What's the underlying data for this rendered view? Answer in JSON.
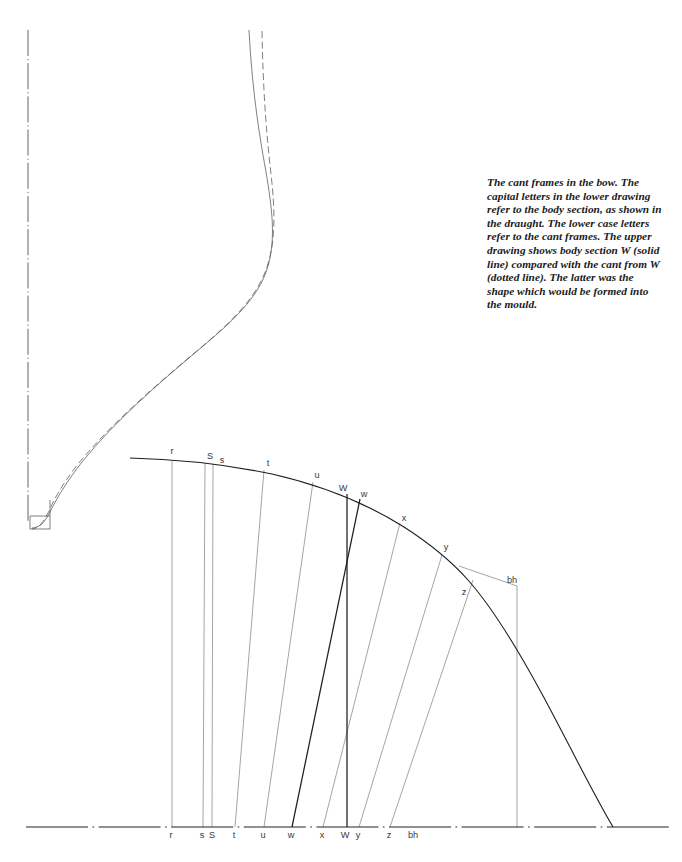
{
  "figure": {
    "caption": "The cant frames in the bow. The capital letters in the lower drawing refer to the body section, as shown in the draught. The lower case letters refer to the cant frames. The upper drawing shows body section W (solid line) compared with the cant from W (dotted line). The latter was the shape which would be formed into the mould.",
    "colors": {
      "ink": "#1e1e1e",
      "line": "#4a4a4a",
      "label": "#3a3a3a",
      "background": "#ffffff"
    }
  },
  "upper_drawing": {
    "name": "body-section-vs-cant-frame-W",
    "centerline": {
      "x": 28,
      "y_top": 30,
      "y_bottom": 522
    },
    "keel": {
      "x": 30,
      "y": 516,
      "width": 20,
      "height": 13
    },
    "solid_line_label": "W (solid line) body section",
    "dotted_line_label": "cant from W (dotted line)"
  },
  "lower_drawing": {
    "name": "cant-frames-plan",
    "baseline_y": 827,
    "curve_start": {
      "x": 130,
      "y": 458
    },
    "curve_end": {
      "x": 613,
      "y": 827
    },
    "curve_labels": [
      {
        "id": "r",
        "text": "r",
        "x": 172,
        "y": 454
      },
      {
        "id": "S",
        "text": "S",
        "x": 210,
        "y": 459
      },
      {
        "id": "s",
        "text": "s",
        "x": 222,
        "y": 463
      },
      {
        "id": "t",
        "text": "t",
        "x": 268,
        "y": 466
      },
      {
        "id": "u",
        "text": "u",
        "x": 317,
        "y": 478
      },
      {
        "id": "W",
        "text": "W",
        "x": 343,
        "y": 491
      },
      {
        "id": "w",
        "text": "w",
        "x": 364,
        "y": 497
      },
      {
        "id": "x",
        "text": "x",
        "x": 404,
        "y": 521
      },
      {
        "id": "y",
        "text": "y",
        "x": 446,
        "y": 550
      },
      {
        "id": "z",
        "text": "z",
        "x": 464,
        "y": 595
      },
      {
        "id": "bh",
        "text": "bh",
        "x": 512,
        "y": 583
      }
    ],
    "baseline_labels": [
      {
        "id": "r",
        "text": "r",
        "x": 171
      },
      {
        "id": "s",
        "text": "s",
        "x": 202
      },
      {
        "id": "S",
        "text": "S",
        "x": 212
      },
      {
        "id": "t",
        "text": "t",
        "x": 234
      },
      {
        "id": "u",
        "text": "u",
        "x": 263
      },
      {
        "id": "w",
        "text": "w",
        "x": 291
      },
      {
        "id": "x",
        "text": "x",
        "x": 322
      },
      {
        "id": "W",
        "text": "W",
        "x": 345
      },
      {
        "id": "y",
        "text": "y",
        "x": 358
      },
      {
        "id": "z",
        "text": "z",
        "x": 389
      },
      {
        "id": "bh",
        "text": "bh",
        "x": 413
      }
    ],
    "baseline_label_y": 838,
    "frame_lines": [
      {
        "id": "r",
        "top_x": 172,
        "top_y": 461,
        "bottom_x": 172,
        "bottom_y": 827,
        "weight": "thin"
      },
      {
        "id": "s",
        "top_x": 205,
        "top_y": 463,
        "bottom_x": 203,
        "bottom_y": 827,
        "weight": "thin"
      },
      {
        "id": "S",
        "top_x": 213,
        "top_y": 464,
        "bottom_x": 212,
        "bottom_y": 827,
        "weight": "thin"
      },
      {
        "id": "t",
        "top_x": 264,
        "top_y": 470,
        "bottom_x": 235,
        "bottom_y": 827,
        "weight": "thin"
      },
      {
        "id": "u",
        "top_x": 313,
        "top_y": 482,
        "bottom_x": 264,
        "bottom_y": 827,
        "weight": "thin"
      },
      {
        "id": "w",
        "top_x": 360,
        "top_y": 499,
        "bottom_x": 292,
        "bottom_y": 827,
        "weight": "bold"
      },
      {
        "id": "x",
        "top_x": 400,
        "top_y": 523,
        "bottom_x": 323,
        "bottom_y": 827,
        "weight": "thin"
      },
      {
        "id": "W",
        "top_x": 347,
        "top_y": 494,
        "bottom_x": 347,
        "bottom_y": 827,
        "weight": "bold"
      },
      {
        "id": "y",
        "top_x": 442,
        "top_y": 555,
        "bottom_x": 359,
        "bottom_y": 827,
        "weight": "thin"
      },
      {
        "id": "z",
        "top_x": 473,
        "top_y": 580,
        "bottom_x": 390,
        "bottom_y": 827,
        "weight": "thin"
      },
      {
        "id": "bh",
        "top_x": 517,
        "top_y": 586,
        "bottom_x": 517,
        "bottom_y": 827,
        "weight": "thin"
      }
    ],
    "diagonal_bh": {
      "x1": 459,
      "y1": 566,
      "x2": 517,
      "y2": 586
    }
  }
}
